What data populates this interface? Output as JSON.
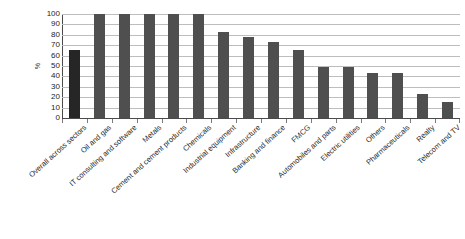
{
  "chart_data": {
    "type": "bar",
    "title": "",
    "xlabel": "",
    "ylabel": "%",
    "ylim": [
      0,
      100
    ],
    "y_ticks": [
      100,
      90,
      80,
      70,
      60,
      50,
      40,
      30,
      20,
      10,
      0
    ],
    "grid": "horizontal",
    "legend": "none",
    "orientation": "vertical",
    "bar_color": "#4f4f4f",
    "highlight_color": "#262626",
    "highlight_index": 0,
    "categories": [
      "Overall across sectors",
      "Oil and gas",
      "IT consulting and software",
      "Metals",
      "Cement and cement products",
      "Chemicals",
      "Industrial equipment",
      "Infrastructure",
      "Banking and finance",
      "FMCG",
      "Automobiles and parts",
      "Electric utilities",
      "Others",
      "Pharmaceuticals",
      "Realty",
      "Telecom and TV"
    ],
    "values": [
      65,
      100,
      100,
      100,
      100,
      100,
      83,
      78,
      73,
      65,
      49,
      49,
      43,
      43,
      23,
      15
    ]
  }
}
